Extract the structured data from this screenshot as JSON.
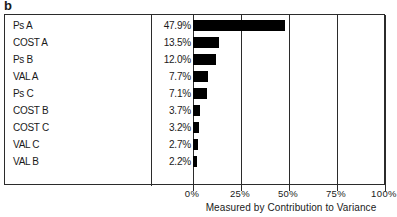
{
  "panel": {
    "letter": "b"
  },
  "chart_data": {
    "type": "bar",
    "orientation": "horizontal",
    "title": "",
    "xlabel": "Measured by Contribution to Variance",
    "ylabel": "",
    "xlim": [
      0,
      100
    ],
    "grid": true,
    "legend": false,
    "value_suffix": "%",
    "categories": [
      "Ps A",
      "COST A",
      "Ps B",
      "VAL A",
      "Ps C",
      "COST B",
      "COST C",
      "VAL C",
      "VAL B"
    ],
    "values": [
      47.9,
      13.5,
      12.0,
      7.7,
      7.1,
      3.7,
      3.2,
      2.7,
      2.2
    ],
    "value_labels": [
      "47.9%",
      "13.5%",
      "12.0%",
      "7.7%",
      "7.1%",
      "3.7%",
      "3.2%",
      "2.7%",
      "2.2%"
    ],
    "xticks": [
      0,
      25,
      50,
      75,
      100
    ],
    "xtick_labels": [
      "0%",
      "25%",
      "50%",
      "75%",
      "100%"
    ],
    "bar_color": "#000000",
    "axis_color": "#2b2b2b",
    "rows": [
      {
        "label": "Ps A",
        "value": 47.9,
        "value_label": "47.9%"
      },
      {
        "label": "COST A",
        "value": 13.5,
        "value_label": "13.5%"
      },
      {
        "label": "Ps B",
        "value": 12.0,
        "value_label": "12.0%"
      },
      {
        "label": "VAL A",
        "value": 7.7,
        "value_label": "7.7%"
      },
      {
        "label": "Ps C",
        "value": 7.1,
        "value_label": "7.1%"
      },
      {
        "label": "COST B",
        "value": 3.7,
        "value_label": "3.7%"
      },
      {
        "label": "COST C",
        "value": 3.2,
        "value_label": "3.2%"
      },
      {
        "label": "VAL C",
        "value": 2.7,
        "value_label": "2.7%"
      },
      {
        "label": "VAL B",
        "value": 2.2,
        "value_label": "2.2%"
      }
    ]
  }
}
